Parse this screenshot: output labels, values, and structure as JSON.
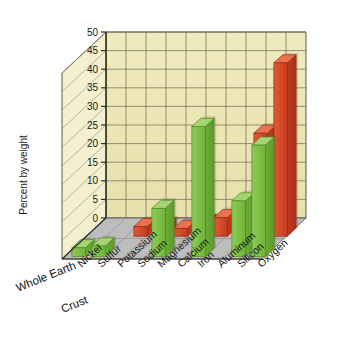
{
  "chart_data": {
    "type": "bar",
    "title": "",
    "subtitle": "",
    "xlabel": "",
    "ylabel": "Percent by weight",
    "ylim": [
      0,
      50
    ],
    "yticks": [
      0,
      5,
      10,
      15,
      20,
      25,
      30,
      35,
      40,
      45,
      50
    ],
    "ytick_labels": [
      "0",
      "5",
      "10",
      "15",
      "20",
      "25",
      "30",
      "35",
      "40",
      "45",
      "50"
    ],
    "grid": true,
    "legend_position": "none",
    "projection": "3d",
    "categories": [
      "Nickel",
      "Sulfur",
      "Potassium",
      "Sodium",
      "Magnesium",
      "Calcium",
      "Iron",
      "Aluminum",
      "Silicon",
      "Oxygen"
    ],
    "series": [
      {
        "name": "Whole Earth",
        "color": "#7cbf3f",
        "values": [
          2.4,
          2.9,
          0.0,
          0.0,
          13.0,
          0.0,
          35.0,
          0.0,
          15.0,
          30.0
        ]
      },
      {
        "name": "Crust",
        "color": "#d4482a",
        "values": [
          0.0,
          0.0,
          2.6,
          2.8,
          2.1,
          3.6,
          5.0,
          8.1,
          27.7,
          46.6
        ]
      }
    ],
    "notes": {
      "depth_axis_labels": [
        "Whole Earth",
        "Crust"
      ],
      "wall_color": "#ece6b4",
      "floor_color": "#b9b9b9",
      "axis_line_color": "#3a3a30"
    }
  },
  "axis": {
    "y_title": "Percent by weight"
  }
}
